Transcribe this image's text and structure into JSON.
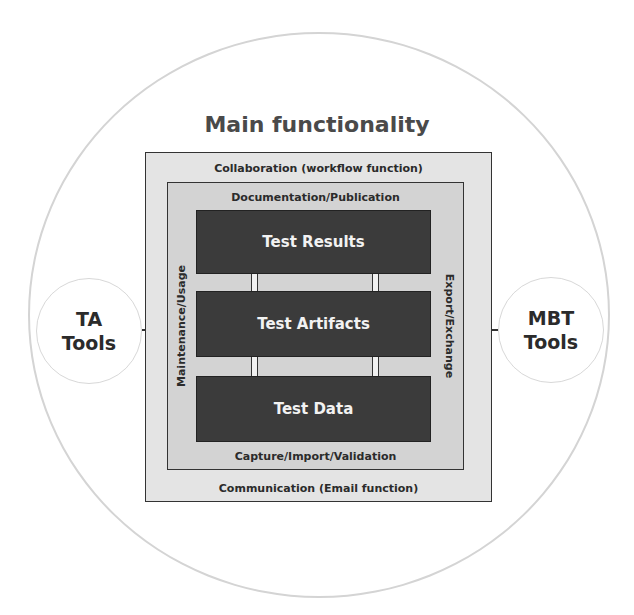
{
  "title": "Main functionality",
  "layers": {
    "outer_top": "Collaboration (workflow function)",
    "outer_bottom": "Communication (Email function)",
    "inner_top": "Documentation/Publication",
    "inner_bottom": "Capture/Import/Validation",
    "inner_left": "Maintenance/Usage",
    "inner_right": "Export/Exchange"
  },
  "core_boxes": [
    {
      "label": "Test Results"
    },
    {
      "label": "Test Artifacts"
    },
    {
      "label": "Test Data"
    }
  ],
  "tools": {
    "left": "TA\nTools",
    "right": "MBT\nTools"
  },
  "colors": {
    "core_box": "#3b3b3b",
    "outer_box": "#e4e4e4",
    "inner_box": "#d3d3d3",
    "ring": "#d4d4d4"
  }
}
